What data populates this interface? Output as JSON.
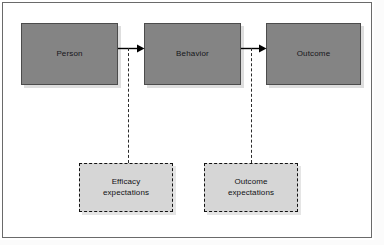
{
  "diagram": {
    "colors": {
      "solid_node_fill": "#848484",
      "solid_node_border": "#4c4c4c",
      "dashed_node_fill": "#d6d6d6",
      "dashed_node_border": "#111111",
      "frame_border": "#6a6a6a",
      "arrow": "#000000",
      "background": "#ffffff"
    },
    "nodes": {
      "person": {
        "label": "Person"
      },
      "behavior": {
        "label": "Behavior"
      },
      "outcome": {
        "label": "Outcome"
      },
      "efficacy_expectations": {
        "line1": "Efficacy",
        "line2": "expectations"
      },
      "outcome_expectations": {
        "line1": "Outcome",
        "line2": "expectations"
      }
    },
    "connectors": {
      "person_to_behavior": {
        "style": "solid-arrow"
      },
      "behavior_to_outcome": {
        "style": "solid-arrow"
      },
      "efficacy_to_person_behavior_link": {
        "style": "dashed"
      },
      "outcome_exp_to_behavior_outcome_link": {
        "style": "dashed"
      }
    }
  }
}
